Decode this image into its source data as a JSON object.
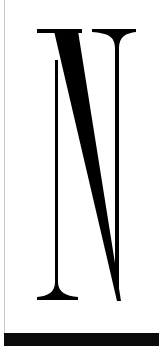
{
  "glyph": {
    "character": "N",
    "color": "#000000",
    "background": "#ffffff"
  },
  "bottom_bar": {
    "color": "#0a0a0a"
  },
  "edge_line": {
    "color": "#c8c8c8"
  }
}
